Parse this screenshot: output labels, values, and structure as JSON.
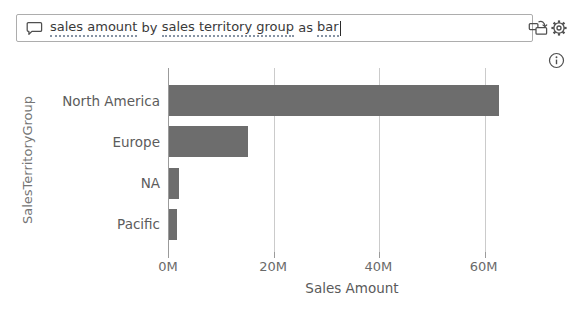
{
  "qa": {
    "query_segments": [
      {
        "text": "sales amount",
        "recognized": true
      },
      {
        "text": " by ",
        "recognized": false
      },
      {
        "text": "sales territory group",
        "recognized": true
      },
      {
        "text": " as ",
        "recognized": false
      },
      {
        "text": "bar",
        "recognized": true
      }
    ],
    "full_query": "sales amount by sales territory group as bar"
  },
  "chart_data": {
    "type": "bar",
    "orientation": "horizontal",
    "title": "",
    "categories": [
      "North America",
      "Europe",
      "NA",
      "Pacific"
    ],
    "values": [
      62.7,
      15.0,
      1.9,
      1.5
    ],
    "value_unit": "M",
    "xlabel": "Sales Amount",
    "ylabel": "SalesTerritoryGroup",
    "xlim": [
      0,
      66.9
    ],
    "xticks": [
      {
        "value": 0,
        "label": "0M"
      },
      {
        "value": 20,
        "label": "20M"
      },
      {
        "value": 40,
        "label": "40M"
      },
      {
        "value": 60,
        "label": "60M"
      }
    ],
    "grid": true,
    "legend": false,
    "bar_color": "#6d6d6d",
    "gridline_color": "#cbcbcb",
    "axis_color": "#9b9b9b"
  }
}
